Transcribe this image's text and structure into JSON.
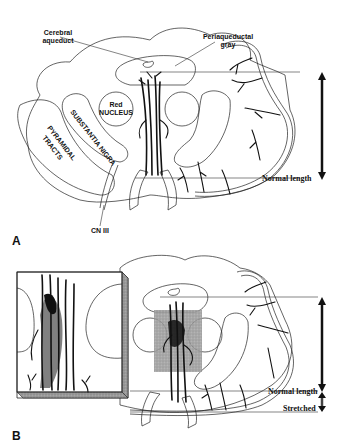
{
  "figure": {
    "panel_a": {
      "label": "A",
      "labels": {
        "cerebral_aqueduct_line1": "Cerebral",
        "cerebral_aqueduct_line2": "aqueduct",
        "periaqueductal_line1": "Periaqueductal",
        "periaqueductal_line2": "gray",
        "red_nucleus_line1": "Red",
        "red_nucleus_line2": "NUCLEUS",
        "substantia_nigra": "SUBSTANTIA NIGRA",
        "pyramidal_line1": "PYRAMIDAL",
        "pyramidal_line2": "TRACTS",
        "cn_iii": "CN III",
        "normal_length": "Normal length"
      }
    },
    "panel_b": {
      "label": "B",
      "labels": {
        "normal_length": "Normal length",
        "stretched": "Stretched"
      }
    },
    "colors": {
      "line": "#111111",
      "shading": "#8a8a8a",
      "background": "#ffffff"
    }
  }
}
